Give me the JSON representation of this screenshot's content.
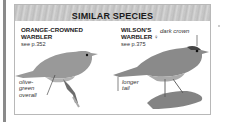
{
  "panel": {
    "header": "SIMILAR SPECIES",
    "species": [
      {
        "name_line1": "ORANGE-CROWNED",
        "name_line2": "WARBLER",
        "ref": "see p.352",
        "annotations": [
          "olive-",
          "green",
          "overall"
        ]
      },
      {
        "name_line1": "WILSON'S",
        "name_line2": "WARBLER",
        "sex_symbol": "♀",
        "ref": "see p.375",
        "annotations": {
          "crown": "dark crown",
          "tail_line1": "longer",
          "tail_line2": "tail"
        }
      }
    ]
  },
  "colors": {
    "header_bg": "#c6c6c6",
    "border": "#b8b8b8",
    "bird": "#8e8e8e"
  }
}
